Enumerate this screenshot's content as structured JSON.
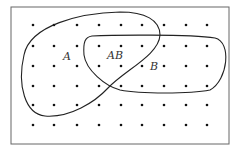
{
  "diagram": {
    "type": "venn-sample-space",
    "frame": {
      "x": 11,
      "y": 7,
      "w": 218,
      "h": 137
    },
    "grid": {
      "columns": [
        33,
        54,
        77,
        99,
        121,
        142,
        164,
        186,
        207
      ],
      "rows": [
        25,
        46,
        66,
        86,
        105,
        125
      ]
    },
    "labels": {
      "a": "A",
      "ab": "AB",
      "b": "B"
    },
    "colors": {
      "stroke": "#222222",
      "dot": "#111111",
      "frame": "#555555"
    }
  }
}
